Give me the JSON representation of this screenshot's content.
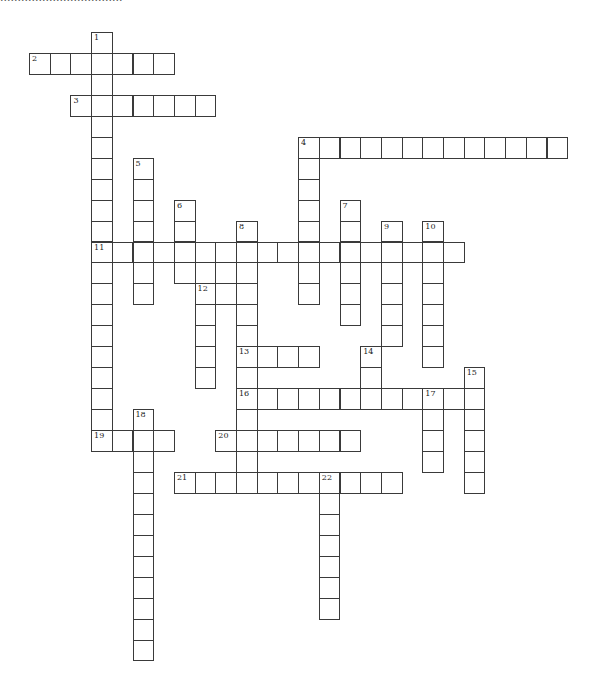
{
  "page": {
    "caption": "...................................",
    "type": "crossword-puzzle"
  },
  "grid": {
    "origin_x": 29,
    "origin_y": 32,
    "cell_w": 20.7,
    "cell_h": 20.95,
    "line_color": "#3a3a3a",
    "background": "#ffffff"
  },
  "words": [
    {
      "number": "1",
      "direction": "down",
      "col": 3,
      "row": 0,
      "length": 20
    },
    {
      "number": "2",
      "direction": "across",
      "col": 0,
      "row": 1,
      "length": 7
    },
    {
      "number": "3",
      "direction": "across",
      "col": 2,
      "row": 3,
      "length": 7
    },
    {
      "number": "4",
      "direction": "across",
      "col": 13,
      "row": 5,
      "length": 13
    },
    {
      "number": "4",
      "direction": "down",
      "col": 13,
      "row": 5,
      "length": 8
    },
    {
      "number": "5",
      "direction": "down",
      "col": 5,
      "row": 6,
      "length": 7
    },
    {
      "number": "6",
      "direction": "down",
      "col": 7,
      "row": 8,
      "length": 4
    },
    {
      "number": "7",
      "direction": "down",
      "col": 15,
      "row": 8,
      "length": 6
    },
    {
      "number": "8",
      "direction": "down",
      "col": 10,
      "row": 9,
      "length": 13
    },
    {
      "number": "9",
      "direction": "down",
      "col": 17,
      "row": 9,
      "length": 6
    },
    {
      "number": "10",
      "direction": "down",
      "col": 19,
      "row": 9,
      "length": 7
    },
    {
      "number": "11",
      "direction": "across",
      "col": 3,
      "row": 10,
      "length": 18
    },
    {
      "number": "12",
      "direction": "across",
      "col": 8,
      "row": 12,
      "length": 3
    },
    {
      "number": "12",
      "direction": "down",
      "col": 8,
      "row": 12,
      "length": 5
    },
    {
      "number": "13",
      "direction": "across",
      "col": 10,
      "row": 15,
      "length": 4
    },
    {
      "number": "14",
      "direction": "down",
      "col": 16,
      "row": 15,
      "length": 2
    },
    {
      "number": "15",
      "direction": "down",
      "col": 21,
      "row": 16,
      "length": 6
    },
    {
      "number": "16",
      "direction": "across",
      "col": 10,
      "row": 17,
      "length": 12
    },
    {
      "number": "17",
      "direction": "down",
      "col": 19,
      "row": 17,
      "length": 4
    },
    {
      "number": "18",
      "direction": "down",
      "col": 5,
      "row": 18,
      "length": 12
    },
    {
      "number": "19",
      "direction": "across",
      "col": 3,
      "row": 19,
      "length": 4
    },
    {
      "number": "20",
      "direction": "across",
      "col": 9,
      "row": 19,
      "length": 7
    },
    {
      "number": "21",
      "direction": "across",
      "col": 7,
      "row": 21,
      "length": 11
    },
    {
      "number": "22",
      "direction": "down",
      "col": 14,
      "row": 21,
      "length": 7
    }
  ],
  "extra_cells": [
    {
      "col": 8,
      "row": 11
    },
    {
      "col": 9,
      "row": 11
    }
  ]
}
